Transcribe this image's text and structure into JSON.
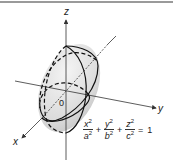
{
  "diagram": {
    "axes": {
      "x_label": "x",
      "y_label": "y",
      "z_label": "z",
      "origin_label": "0"
    },
    "equation": {
      "terms": [
        {
          "num": "x",
          "den": "a",
          "exp": "2"
        },
        {
          "num": "y",
          "den": "b",
          "exp": "2"
        },
        {
          "num": "z",
          "den": "c",
          "exp": "2"
        }
      ],
      "plus": "+",
      "equals": "=",
      "rhs": "1"
    },
    "colors": {
      "surface": "#e2e2e2",
      "outline": "#111111",
      "axis": "#333333"
    }
  }
}
